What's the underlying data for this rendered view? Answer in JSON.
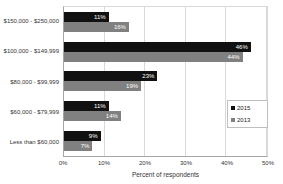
{
  "chart_data": {
    "type": "bar",
    "orientation": "horizontal",
    "title": "",
    "xlabel": "Percent of respondents",
    "ylabel": "",
    "xlim": [
      0,
      50
    ],
    "xticks": [
      "0%",
      "10%",
      "20%",
      "30%",
      "40%",
      "50%"
    ],
    "grid": true,
    "legend_position": "middle-right",
    "categories": [
      "$150,000 - $250,000",
      "$100,000 - $149,999",
      "$80,000 - $99,999",
      "$60,000 - $79,999",
      "Less than $60,000"
    ],
    "series": [
      {
        "name": "2015",
        "color": "#111111",
        "values": [
          11,
          46,
          23,
          11,
          9
        ],
        "labels": [
          "11%",
          "46%",
          "23%",
          "11%",
          "9%"
        ]
      },
      {
        "name": "2013",
        "color": "#808080",
        "values": [
          16,
          44,
          19,
          14,
          7
        ],
        "labels": [
          "16%",
          "44%",
          "19%",
          "14%",
          "7%"
        ]
      }
    ],
    "data_label_color": "#ffffff"
  },
  "colors": {
    "background": "#ffffff",
    "gridline": "#d9d9d9",
    "axis_line": "#a6a6a6",
    "text": "#333333",
    "legend_border": "#bfbfbf"
  }
}
